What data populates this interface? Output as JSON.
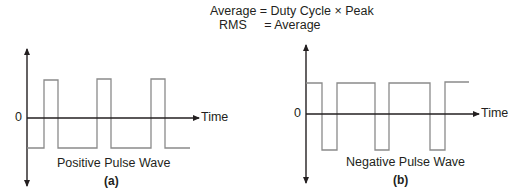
{
  "formulas": {
    "line1": "Average = Duty Cycle × Peak",
    "line2": "RMS     = Average"
  },
  "panels": [
    {
      "id": "a",
      "title": "Positive Pulse Wave",
      "caption": "(a)",
      "zero_label": "0",
      "axis_label": "Time",
      "wave_type": "positive-pulse"
    },
    {
      "id": "b",
      "title": "Negative Pulse Wave",
      "caption": "(b)",
      "zero_label": "0",
      "axis_label": "Time",
      "wave_type": "negative-pulse"
    }
  ],
  "colors": {
    "axis": "#231f20",
    "waveform": "#8a8a8a"
  }
}
